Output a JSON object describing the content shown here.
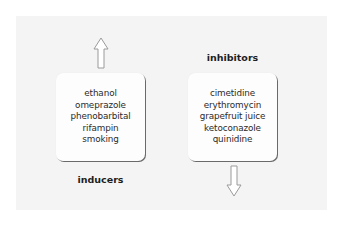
{
  "diagram": {
    "inducers": {
      "label": "inducers",
      "arrow": "up-arrow",
      "items": [
        "ethanol",
        "omeprazole",
        "phenobarbital",
        "rifampin",
        "smoking"
      ]
    },
    "inhibitors": {
      "label": "inhibitors",
      "arrow": "down-arrow",
      "items": [
        "cimetidine",
        "erythromycin",
        "grapefruit juice",
        "ketoconazole",
        "quinidine"
      ]
    }
  },
  "colors": {
    "panel": "#f4f4f4",
    "box": "#fdfdfd",
    "text": "#2a2a2a",
    "arrow_stroke": "#9a9a9a"
  }
}
